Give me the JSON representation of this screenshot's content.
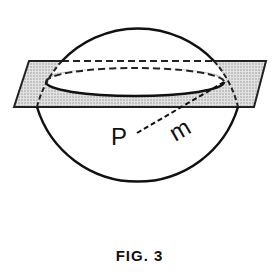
{
  "figure": {
    "caption": "FIG. 3",
    "labels": {
      "point": "P",
      "radius": "m"
    },
    "elements": {
      "sphere": "circle outline representing a sphere",
      "plane": "shaded parallelogram plane intersecting the sphere",
      "cross_section": "ellipse where plane cuts sphere (front solid, back dashed)",
      "radius_line": "dashed line from P to the edge of the cross-section"
    },
    "colors": {
      "stroke": "#111111",
      "plane_fill": "#cfcfcf",
      "background": "#ffffff"
    }
  }
}
